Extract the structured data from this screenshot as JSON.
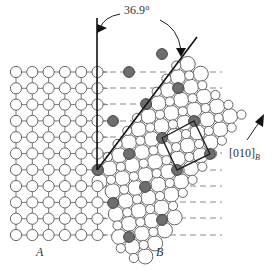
{
  "angle_label": "36.9°",
  "grain_a_label": "A",
  "grain_b_label": "B",
  "direction_label": "[010]",
  "direction_subscript": "B",
  "colors": {
    "atom_fill": "#ffffff",
    "atom_stroke": "#666666",
    "coincidence_fill": "#6e6e6e",
    "bond": "#777777",
    "dash": "#8a8a8a",
    "line": "#111111"
  },
  "grain_a": {
    "origin": [
      16,
      72
    ],
    "spacing": 16.3,
    "cols": 6,
    "rows": 11,
    "atom_radius": 5.6
  },
  "grain_b": {
    "origin": [
      98,
      170
    ],
    "b1": [
      9.78,
      -13.04
    ],
    "b2": [
      13.04,
      9.78
    ],
    "atom_radius": 4.6,
    "large_radius": 7.6
  },
  "coincidence_sites": [
    [
      162,
      54
    ],
    [
      129,
      72
    ],
    [
      178,
      88
    ],
    [
      146,
      104
    ],
    [
      113,
      121
    ],
    [
      194,
      121
    ],
    [
      162,
      138
    ],
    [
      129,
      154
    ],
    [
      210,
      154
    ],
    [
      98,
      170
    ],
    [
      177,
      170
    ],
    [
      145,
      187
    ],
    [
      113,
      203
    ],
    [
      162,
      220
    ],
    [
      129,
      237
    ]
  ],
  "dashed_rows_y": [
    72,
    88,
    104,
    121,
    137,
    153,
    170,
    186,
    202,
    218,
    235
  ],
  "boundary_vertical": {
    "x": 97,
    "y1": 18,
    "y2": 170
  },
  "boundary_inclined": {
    "x1": 97,
    "y1": 170,
    "x2": 197,
    "y2": 37
  },
  "csl_cell": [
    [
      162,
      138
    ],
    [
      194,
      121
    ],
    [
      210,
      154
    ],
    [
      177,
      170
    ]
  ]
}
